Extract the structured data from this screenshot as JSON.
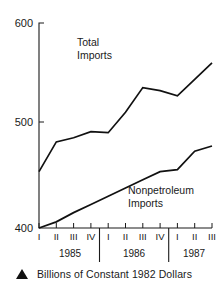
{
  "figure": {
    "caption": "Billions of Constant 1982 Dollars",
    "caption_marker": "filled-triangle-up"
  },
  "chart_data": {
    "type": "line",
    "title": "",
    "xlabel": "",
    "ylabel": "",
    "ylim": [
      400,
      600
    ],
    "yticks": [
      400,
      500,
      600
    ],
    "ytick_labels": [
      "400",
      "500",
      "600"
    ],
    "grid": false,
    "legend": "inline-labels",
    "x": [
      "1985 I",
      "1985 II",
      "1985 III",
      "1985 IV",
      "1986 I",
      "1986 II",
      "1986 III",
      "1986 IV",
      "1987 I",
      "1987 II",
      "1987 III"
    ],
    "quarter_labels": [
      "I",
      "II",
      "III",
      "IV",
      "I",
      "II",
      "III",
      "IV",
      "I",
      "II",
      "III"
    ],
    "year_groups": [
      {
        "label": "1985",
        "quarters": [
          "I",
          "II",
          "III",
          "IV"
        ]
      },
      {
        "label": "1986",
        "quarters": [
          "I",
          "II",
          "III",
          "IV"
        ]
      },
      {
        "label": "1987",
        "quarters": [
          "I",
          "II",
          "III"
        ]
      }
    ],
    "series": [
      {
        "name": "Total Imports",
        "label": "Total\nImports",
        "label_line1": "Total",
        "label_line2": "Imports",
        "color": "#111111",
        "values": [
          455,
          484,
          488,
          494,
          493,
          513,
          537,
          534,
          529,
          545,
          561
        ]
      },
      {
        "name": "Nonpetroleum Imports",
        "label": "Nonpetroleum\nImports",
        "label_line1": "Nonpetroleum",
        "label_line2": "Imports",
        "color": "#111111",
        "values": [
          400,
          406,
          415,
          423,
          431,
          439,
          447,
          455,
          457,
          475,
          480
        ]
      }
    ]
  },
  "axes": {
    "y_top_label": "600",
    "y_mid_label": "500",
    "y_bottom_label": "400"
  }
}
